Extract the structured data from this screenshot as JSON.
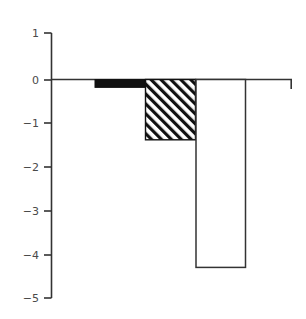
{
  "chart": {
    "title": "Lumbar spine"
  },
  "chart_data": {
    "type": "bar",
    "title": "Lumbar spine",
    "subtitle": "",
    "xlabel": "",
    "ylabel": "",
    "categories": [
      "bar-1",
      "bar-2",
      "bar-3"
    ],
    "values": [
      -0.18,
      -1.38,
      -4.3
    ],
    "series": [
      {
        "name": "Lumbar spine",
        "values": [
          -0.18,
          -1.38,
          -4.3
        ],
        "fills": [
          "solid-black",
          "diagonal-hatch",
          "open-white"
        ],
        "colors": [
          "#000000",
          "#ffffff",
          "#ffffff"
        ]
      }
    ],
    "ylim": [
      -5,
      1
    ],
    "yticks": [
      1,
      0,
      -1,
      -2,
      -3,
      -4,
      -5
    ],
    "ytick_labels": [
      "1",
      "0",
      "−1",
      "−2",
      "−3",
      "−4",
      "−5"
    ],
    "xticks": [],
    "xtick_labels": [],
    "grid": false,
    "legend": false,
    "legend_position": "none",
    "annotations": [],
    "axis_color": "#333333",
    "background_color": "#ffffff",
    "zero_line": 0
  },
  "axis": {
    "y_tick_1": "1",
    "y_tick_0": "0",
    "y_tick_m1": "−1",
    "y_tick_m2": "−2",
    "y_tick_m3": "−3",
    "y_tick_m4": "−4",
    "y_tick_m5": "−5"
  }
}
